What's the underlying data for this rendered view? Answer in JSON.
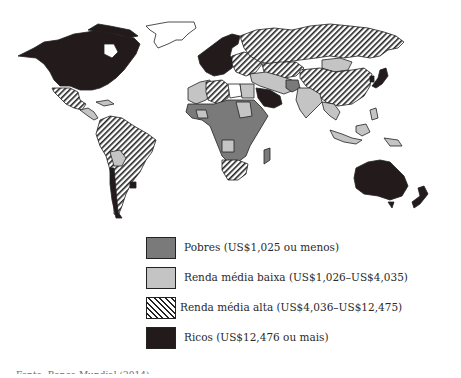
{
  "map": {
    "title": "Classificação dos países por renda",
    "categories": [
      {
        "id": "poor",
        "label": "Pobres (US$1,025 ou menos)",
        "fill": "#7a7a7a",
        "pattern": "solid"
      },
      {
        "id": "lowmid",
        "label": "Renda média baixa (US$1,026–US$4,035)",
        "fill": "#c4c4c4",
        "pattern": "solid"
      },
      {
        "id": "highmid",
        "label": "Renda média alta (US$4,036–US$12,475)",
        "fill": "#ffffff",
        "pattern": "diagonal-hatch"
      },
      {
        "id": "rich",
        "label": "Ricos (US$12,476 ou mais)",
        "fill": "#231a1c",
        "pattern": "solid"
      }
    ],
    "regions": [
      {
        "name": "North America (USA, Canada)",
        "category": "rich"
      },
      {
        "name": "Greenland",
        "category": "none"
      },
      {
        "name": "Mexico",
        "category": "highmid"
      },
      {
        "name": "Central America",
        "category": "lowmid"
      },
      {
        "name": "South America",
        "category": "highmid"
      },
      {
        "name": "Bolivia",
        "category": "lowmid"
      },
      {
        "name": "Chile",
        "category": "rich"
      },
      {
        "name": "Uruguay",
        "category": "rich"
      },
      {
        "name": "Western Europe",
        "category": "rich"
      },
      {
        "name": "Eastern Europe",
        "category": "highmid"
      },
      {
        "name": "Russia",
        "category": "highmid"
      },
      {
        "name": "China",
        "category": "highmid"
      },
      {
        "name": "Mongolia",
        "category": "lowmid"
      },
      {
        "name": "Japan",
        "category": "rich"
      },
      {
        "name": "Saudi Arabia",
        "category": "rich"
      },
      {
        "name": "Afghanistan",
        "category": "poor"
      },
      {
        "name": "India",
        "category": "lowmid"
      },
      {
        "name": "Southeast Asia",
        "category": "lowmid"
      },
      {
        "name": "Algeria / Libya",
        "category": "highmid"
      },
      {
        "name": "Egypt",
        "category": "lowmid"
      },
      {
        "name": "Sub-Saharan Africa",
        "category": "poor"
      },
      {
        "name": "South Africa",
        "category": "highmid"
      },
      {
        "name": "Madagascar",
        "category": "poor"
      },
      {
        "name": "Australia",
        "category": "rich"
      },
      {
        "name": "New Zealand",
        "category": "rich"
      }
    ]
  },
  "caption": "Fonte: Banco Mundial (2014)"
}
